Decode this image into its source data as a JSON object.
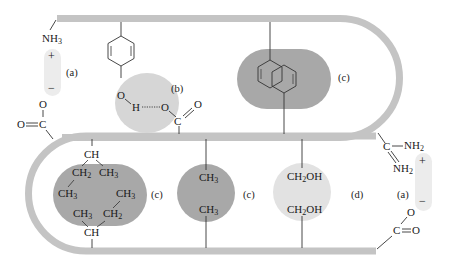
{
  "diagram": {
    "type": "protein-tertiary-structure-interactions",
    "colors": {
      "backbone": "#c4c4c4",
      "ionic_blob": "#ececec",
      "hbond_blob": "#d6d6d6",
      "hydrophobic_blob": "#a8a8a8",
      "disulfide_like_blob": "#e2e2e2",
      "line": "#333333",
      "text": "#1a1a1a"
    },
    "interactions": {
      "ionic_left": {
        "tag": "(a)",
        "top_group": "NH",
        "top_sub": "3",
        "plus": "+",
        "minus": "−",
        "bottom_o": "O",
        "bottom_c": "C",
        "bottom_o2": "O"
      },
      "hbond": {
        "tag": "(b)",
        "o_left": "O",
        "h": "H",
        "o_right": "O",
        "c": "C",
        "o_double": "O"
      },
      "aromatic": {
        "tag": "(c)"
      },
      "hydrophobic_branched": {
        "tag": "(c)",
        "top_ch": "CH",
        "ch2_top": "CH",
        "ch2_top_sub": "2",
        "ch3_top_right": "CH",
        "ch3_top_right_sub": "3",
        "ch3_top_left": "CH",
        "ch3_top_left_sub": "3",
        "ch3_bottom_right": "CH",
        "ch3_bottom_right_sub": "3",
        "ch3_bottom_left": "CH",
        "ch3_bottom_left_sub": "3",
        "ch2_bottom": "CH",
        "ch2_bottom_sub": "2",
        "bottom_ch": "CH"
      },
      "hydrophobic_methyl": {
        "tag": "(c)",
        "top": "CH",
        "top_sub": "3",
        "bottom": "CH",
        "bottom_sub": "3"
      },
      "hydroxyl": {
        "tag": "(d)",
        "top": "CH",
        "top_sub": "2",
        "top_suffix": "OH",
        "bottom": "CH",
        "bottom_sub": "2",
        "bottom_suffix": "OH"
      },
      "ionic_right": {
        "tag": "(a)",
        "c": "C",
        "nh2_top": "NH",
        "nh2_top_sub": "2",
        "nh2_bottom": "NH",
        "nh2_bottom_sub": "2",
        "plus": "+",
        "minus": "−",
        "o_top": "O",
        "c_bottom": "C",
        "o_double": "O"
      }
    }
  }
}
